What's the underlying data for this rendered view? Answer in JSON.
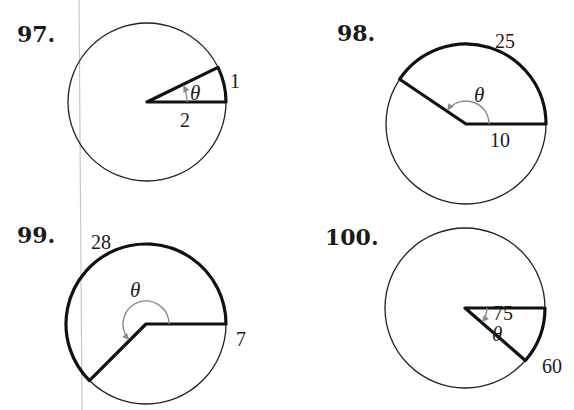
{
  "page": {
    "margin_line": {
      "x1": 79,
      "y1": 0,
      "x2": 82,
      "y2": 410,
      "color": "#c8c8c8"
    }
  },
  "problems": [
    {
      "number": "97.",
      "number_pos": [
        17,
        42
      ],
      "circle": {
        "cx": 147,
        "cy": 102,
        "r": 79
      },
      "radius_value": "2",
      "arc_length": "1",
      "angle_symbol": "θ",
      "start_deg": 0,
      "end_deg": 26,
      "direction": "counterclockwise",
      "radius_label_pos": [
        180,
        127
      ],
      "arc_label_pos": [
        230,
        88
      ],
      "theta_pos": [
        190,
        100
      ],
      "angle_arc_r": 40
    },
    {
      "number": "98.",
      "number_pos": [
        337,
        41
      ],
      "circle": {
        "cx": 466,
        "cy": 124,
        "r": 80
      },
      "radius_value": "10",
      "arc_length": "25",
      "angle_symbol": "θ",
      "start_deg": 0,
      "end_deg": 146,
      "direction": "counterclockwise",
      "radius_label_pos": [
        490,
        147
      ],
      "arc_label_pos": [
        495,
        48
      ],
      "theta_pos": [
        474,
        102
      ],
      "angle_arc_r": 23
    },
    {
      "number": "99.",
      "number_pos": [
        17,
        243
      ],
      "circle": {
        "cx": 146,
        "cy": 324,
        "r": 80
      },
      "radius_value": "7",
      "arc_length": "28",
      "angle_symbol": "θ",
      "start_deg": 0,
      "end_deg": 225,
      "direction": "counterclockwise",
      "radius_label_pos": [
        236,
        346
      ],
      "arc_label_pos": [
        91,
        249
      ],
      "theta_pos": [
        130,
        297
      ],
      "angle_arc_r": 23
    },
    {
      "number": "100.",
      "number_pos": [
        325,
        245
      ],
      "circle": {
        "cx": 465,
        "cy": 308,
        "r": 80
      },
      "radius_value": "75",
      "arc_length": "60",
      "angle_symbol": "θ",
      "start_deg": 0,
      "end_deg": -41,
      "direction": "clockwise",
      "radius_label_pos": [
        493,
        320
      ],
      "arc_label_pos": [
        542,
        373
      ],
      "theta_pos": [
        492,
        341
      ],
      "angle_arc_r": 22
    }
  ]
}
